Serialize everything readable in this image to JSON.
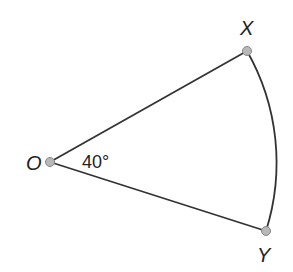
{
  "diagram": {
    "type": "sector",
    "points": {
      "O": {
        "label": "O",
        "x": 50,
        "y": 162
      },
      "X": {
        "label": "X",
        "x": 247,
        "y": 51
      },
      "Y": {
        "label": "Y",
        "x": 266,
        "y": 231
      }
    },
    "angle": {
      "label": "40°",
      "vertex": "O",
      "between": [
        "OX",
        "OY"
      ]
    },
    "radius": 226,
    "colors": {
      "line": "#333333",
      "point_fill": "#b8b8b8",
      "point_stroke": "#888888",
      "background": "#ffffff"
    }
  }
}
